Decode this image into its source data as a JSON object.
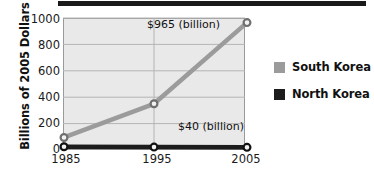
{
  "chart_data": {
    "type": "line",
    "title": "",
    "subtitle": "",
    "xlabel": "",
    "ylabel": "Billions of 2005 Dollars",
    "categories": [
      "1985",
      "1995",
      "2005"
    ],
    "x": [
      1985,
      1995,
      2005
    ],
    "xlim": [
      1985,
      2005
    ],
    "ylim": [
      0,
      1000
    ],
    "yticks": [
      1000,
      800,
      600,
      400,
      200,
      0
    ],
    "grid": true,
    "legend_position": "right",
    "series": [
      {
        "name": "South Korea",
        "color": "#9b9b9b",
        "values": [
          95,
          350,
          965
        ],
        "marker": "circle"
      },
      {
        "name": "North Korea",
        "color": "#1c1c1c",
        "values": [
          25,
          22,
          20
        ],
        "marker": "circle"
      }
    ],
    "annotations": [
      {
        "text": "$965 (billion)",
        "series": "South Korea",
        "x": 2005
      },
      {
        "text": "$40 (billion)",
        "series": "North Korea",
        "x": 2005
      }
    ]
  },
  "axes": {
    "y_title": "Billions of 2005 Dollars",
    "y_tick_labels": [
      "1000",
      "800",
      "600",
      "400",
      "200",
      "0"
    ],
    "x_tick_labels": [
      "1985",
      "1995",
      "2005"
    ]
  },
  "legend": {
    "items": [
      {
        "label": "South Korea",
        "swatch_color": "#9b9b9b"
      },
      {
        "label": "North Korea",
        "swatch_color": "#1c1c1c"
      }
    ]
  },
  "callouts": {
    "south_korea": "$965 (billion)",
    "north_korea": "$40 (billion)"
  },
  "style": {
    "plot_background": "#e9e9e9",
    "gridline_color": "#b4b4b4",
    "plot_border_color": "#9a9a9a",
    "south_korea_color": "#9b9b9b",
    "north_korea_color": "#1c1c1c",
    "top_rule_color": "#1a1a1a"
  }
}
